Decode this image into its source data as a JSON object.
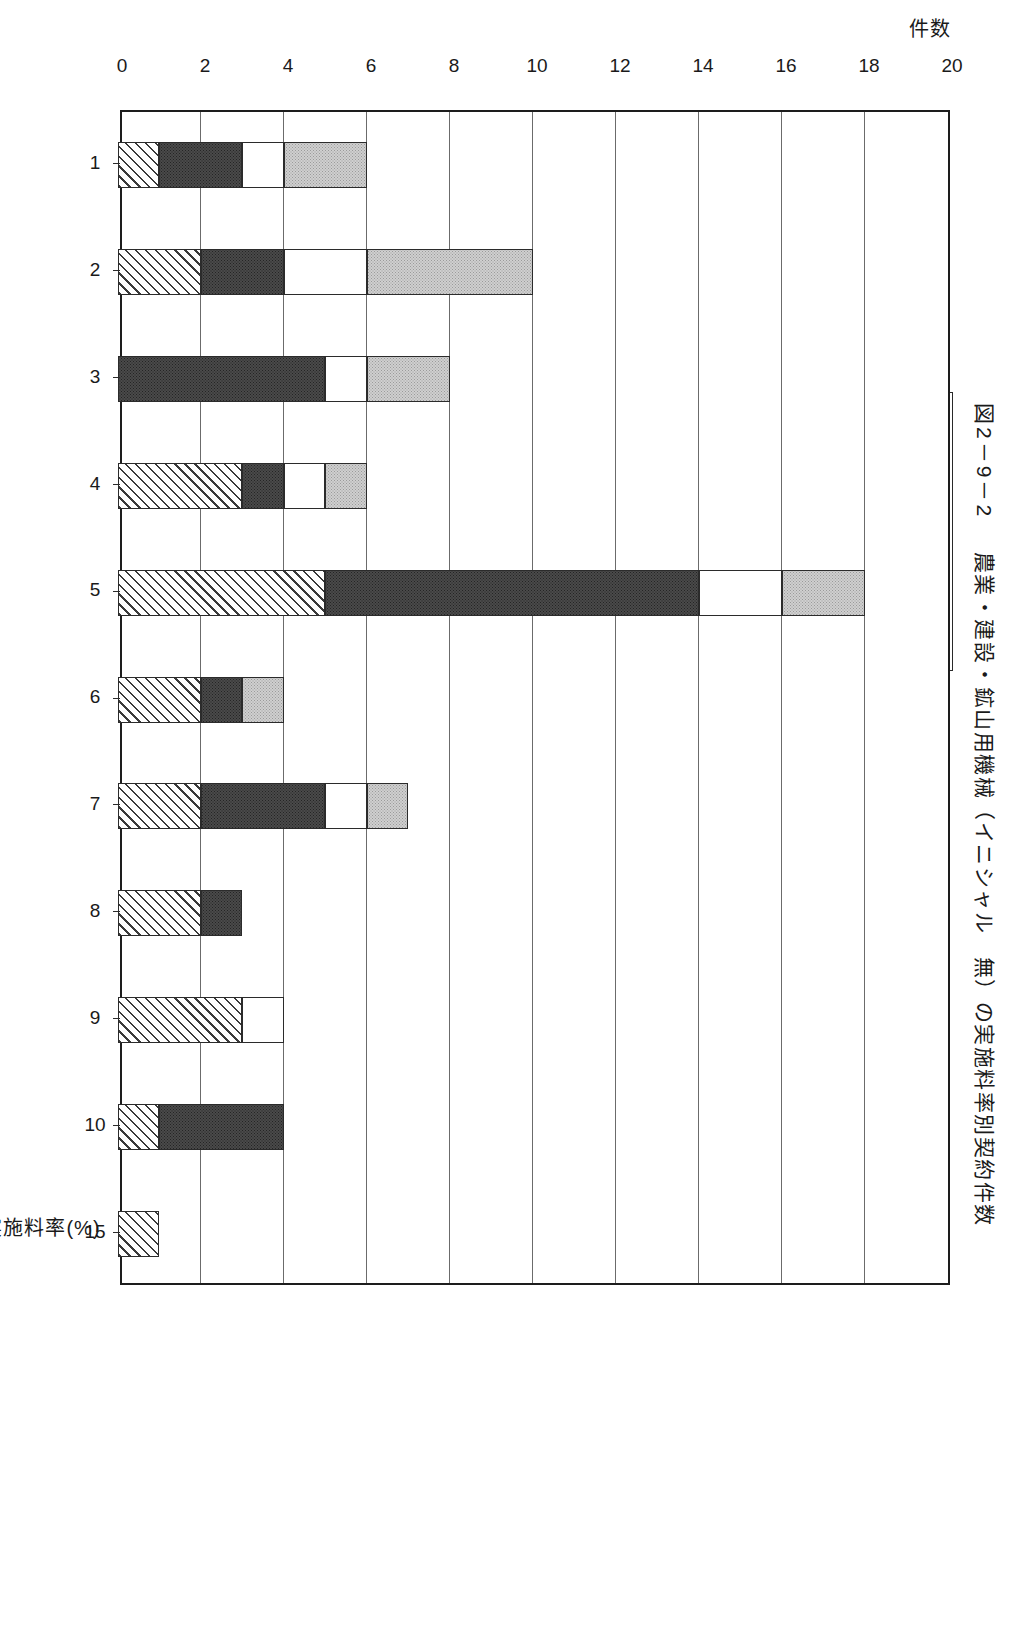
{
  "figure": {
    "number": "図2－9－2",
    "title": "農業・建設・鉱山用機械（イニシャル　無）の実施料率別契約件数"
  },
  "legend": {
    "items": [
      {
        "swatch": "gray",
        "label": "平成4年度"
      },
      {
        "swatch": "none",
        "label": "～平成10年度総件数累計"
      },
      {
        "swatch": "white",
        "label": "昭和63年度"
      },
      {
        "swatch": "none",
        "label": "～平成3年度総件数累計"
      },
      {
        "swatch": "dark",
        "label": "昭和49年"
      },
      {
        "swatch": "none",
        "label": "～昭和52年　総件数累計"
      },
      {
        "swatch": "hatch",
        "label": "昭和43年"
      },
      {
        "swatch": "none",
        "label": "～昭和48年　総件数累計"
      }
    ]
  },
  "axes": {
    "value_axis_title": "件数",
    "value_ticks": [
      "20",
      "18",
      "16",
      "14",
      "12",
      "10",
      "8",
      "6",
      "4",
      "2",
      "0"
    ],
    "category_axis_title": "実施料率(%)",
    "category_ticks": [
      "1",
      "2",
      "3",
      "4",
      "5",
      "6",
      "7",
      "8",
      "9",
      "10",
      "15"
    ]
  },
  "chart_data": {
    "type": "bar",
    "orientation": "horizontal",
    "stacked": true,
    "title": "農業・建設・鉱山用機械（イニシャル　無）の実施料率別契約件数",
    "xlabel": "実施料率(%)",
    "ylabel": "件数",
    "ylim": [
      0,
      20
    ],
    "grid": true,
    "legend_position": "top",
    "categories": [
      "1",
      "2",
      "3",
      "4",
      "5",
      "6",
      "7",
      "8",
      "9",
      "10",
      "15"
    ],
    "series": [
      {
        "name": "平成4年度～平成10年度総件数累計",
        "swatch": "gray",
        "values": [
          2,
          4,
          2,
          1,
          2,
          1,
          1,
          0,
          0,
          0,
          0
        ]
      },
      {
        "name": "昭和63年度～平成3年度総件数累計",
        "swatch": "white",
        "values": [
          1,
          2,
          1,
          1,
          2,
          0,
          1,
          0,
          1,
          0,
          0
        ]
      },
      {
        "name": "昭和49年～昭和52年　総件数累計",
        "swatch": "dark",
        "values": [
          2,
          2,
          5,
          1,
          9,
          1,
          3,
          1,
          0,
          3,
          0
        ]
      },
      {
        "name": "昭和43年～昭和48年　総件数累計",
        "swatch": "hatch",
        "values": [
          1,
          2,
          0,
          3,
          5,
          2,
          2,
          2,
          3,
          1,
          1
        ]
      }
    ],
    "totals": [
      6,
      10,
      8,
      6,
      18,
      4,
      7,
      3,
      4,
      4,
      1
    ]
  }
}
